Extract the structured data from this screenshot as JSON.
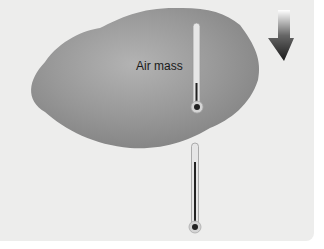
{
  "diagram": {
    "air_mass_label": "Air mass",
    "elements": [
      {
        "name": "air-mass",
        "shape": "irregular blob",
        "color": "#8e8e8e"
      },
      {
        "name": "thermometer-inside-air-mass",
        "mercury_level": "low"
      },
      {
        "name": "thermometer-below-air-mass",
        "mercury_level": "high"
      },
      {
        "name": "downward-arrow",
        "direction": "down",
        "color": "#222222"
      }
    ]
  }
}
